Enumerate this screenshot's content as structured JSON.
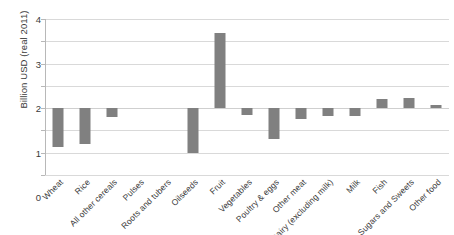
{
  "chart_data": {
    "type": "bar",
    "title": "",
    "xlabel": "",
    "ylabel": "Billion USD (real 2011)",
    "ylim": [
      -3,
      4
    ],
    "yticks": [
      4,
      3,
      2,
      1,
      0,
      -1,
      -2,
      -3
    ],
    "ytick_labels": [
      "4",
      "3",
      "2",
      "1",
      "0",
      "-1",
      "-2",
      "-3"
    ],
    "grid": true,
    "legend": "none",
    "bar_color": "#808080",
    "gridline_color": "#d9d9d9",
    "categories": [
      "Wheat",
      "Rice",
      "All other cereals",
      "Pulses",
      "Roots and tubers",
      "Oilseeds",
      "Fruit",
      "Vegetables",
      "Poultry & eggs",
      "Other meat",
      "Dairy (excluding milk)",
      "Milk",
      "Fish",
      "Sugars and Sweets",
      "Other food"
    ],
    "values": [
      -1.75,
      -1.6,
      -0.4,
      0,
      0,
      -2.0,
      3.35,
      -0.3,
      -1.4,
      -0.5,
      -0.35,
      -0.35,
      0.4,
      0.45,
      0.12
    ]
  }
}
